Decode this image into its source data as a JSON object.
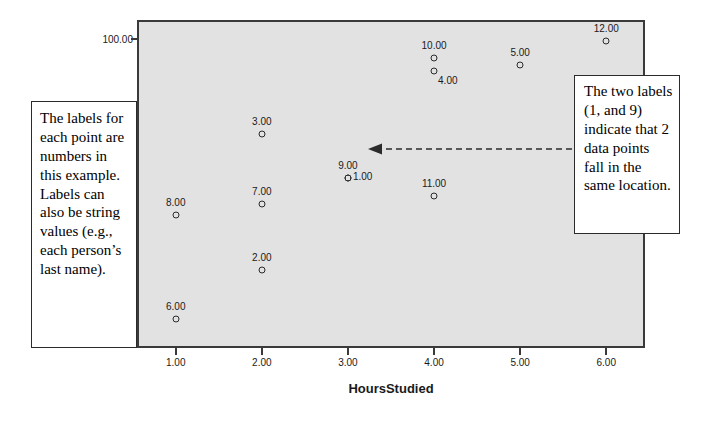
{
  "chart_data": {
    "type": "scatter",
    "title": "",
    "xlabel": "HoursStudied",
    "ylabel": "",
    "xlim": [
      0.55,
      6.45
    ],
    "ylim": [
      74.0,
      101.6
    ],
    "grid": false,
    "legend": "none",
    "x_ticks": [
      "1.00",
      "2.00",
      "3.00",
      "4.00",
      "5.00",
      "6.00"
    ],
    "y_ticks": [
      "100.00",
      "75.00"
    ],
    "point_label_format": "0.00",
    "points": [
      {
        "label": "8.00",
        "x": 1.0,
        "y": 85.2,
        "label_pos": "above"
      },
      {
        "label": "6.00",
        "x": 1.0,
        "y": 76.4,
        "label_pos": "above"
      },
      {
        "label": "3.00",
        "x": 2.0,
        "y": 92.0,
        "label_pos": "above"
      },
      {
        "label": "7.00",
        "x": 2.0,
        "y": 86.1,
        "label_pos": "above"
      },
      {
        "label": "2.00",
        "x": 2.0,
        "y": 80.6,
        "label_pos": "above"
      },
      {
        "label": "9.00",
        "x": 3.0,
        "y": 88.3,
        "label_pos": "above"
      },
      {
        "label": "1.00",
        "x": 3.0,
        "y": 88.3,
        "label_pos": "right"
      },
      {
        "label": "10.00",
        "x": 4.0,
        "y": 98.4,
        "label_pos": "above"
      },
      {
        "label": "4.00",
        "x": 4.0,
        "y": 97.3,
        "label_pos": "below"
      },
      {
        "label": "11.00",
        "x": 4.0,
        "y": 86.8,
        "label_pos": "above"
      },
      {
        "label": "5.00",
        "x": 5.0,
        "y": 97.8,
        "label_pos": "above"
      },
      {
        "label": "12.00",
        "x": 6.0,
        "y": 99.8,
        "label_pos": "above"
      }
    ]
  },
  "annotations": {
    "left_callout": "The labels for each point are numbers in this example. Labels can also be string values (e.g., each person’s last name).",
    "right_callout": "The two labels (1, and 9) indicate that 2 data points fall in the same location.",
    "arrow": "dashed-arrow-pointing-left"
  },
  "colors": {
    "plot_background": "#e2e2e2",
    "page_background": "#ffffff",
    "axis": "#3a3a3a",
    "marker": "#2b2b2b",
    "text": "#1a1a1a",
    "callout_border": "#2b2b2b"
  }
}
